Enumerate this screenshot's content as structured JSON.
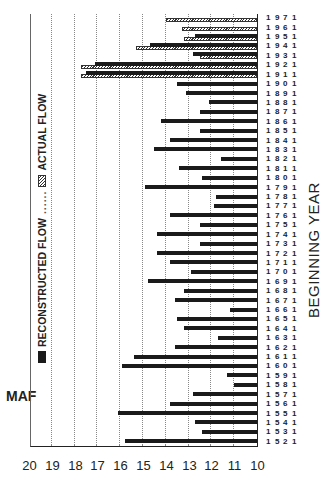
{
  "chart_data": {
    "type": "bar",
    "orientation_note": "figure is displayed rotated 90 degrees counterclockwise",
    "ylabel": "MAF",
    "xlabel": "BEGINNING YEAR",
    "ylim": [
      10,
      20
    ],
    "yticks": [
      10,
      11,
      12,
      13,
      14,
      15,
      16,
      17,
      18,
      19,
      20
    ],
    "grid": true,
    "legend": [
      "RECONSTRUCTED FLOW",
      "ACTUAL FLOW"
    ],
    "categories": [
      "1521",
      "1531",
      "1541",
      "1551",
      "1561",
      "1571",
      "1581",
      "1591",
      "1601",
      "1611",
      "1621",
      "1631",
      "1641",
      "1651",
      "1661",
      "1671",
      "1681",
      "1691",
      "1701",
      "1711",
      "1721",
      "1731",
      "1741",
      "1751",
      "1761",
      "1771",
      "1781",
      "1791",
      "1801",
      "1811",
      "1821",
      "1831",
      "1841",
      "1851",
      "1861",
      "1871",
      "1881",
      "1891",
      "1901",
      "1911",
      "1921",
      "1931",
      "1941",
      "1951",
      "1961",
      "1971"
    ],
    "series": [
      {
        "name": "RECONSTRUCTED FLOW",
        "style": "solid",
        "values": [
          15.8,
          12.4,
          12.7,
          16.1,
          13.8,
          12.8,
          11.0,
          11.3,
          15.9,
          15.4,
          13.6,
          11.7,
          13.2,
          13.5,
          11.2,
          13.6,
          13.2,
          14.8,
          12.9,
          13.8,
          14.4,
          12.5,
          14.4,
          12.5,
          13.8,
          11.9,
          11.8,
          14.9,
          12.4,
          13.4,
          11.6,
          14.5,
          13.8,
          12.5,
          14.2,
          12.5,
          12.1,
          13.1,
          13.5,
          17.5,
          17.1,
          12.8,
          14.7,
          12.7,
          null,
          null
        ]
      },
      {
        "name": "ACTUAL FLOW",
        "style": "hatched",
        "values": [
          null,
          null,
          null,
          null,
          null,
          null,
          null,
          null,
          null,
          null,
          null,
          null,
          null,
          null,
          null,
          null,
          null,
          null,
          null,
          null,
          null,
          null,
          null,
          null,
          null,
          null,
          null,
          null,
          null,
          null,
          null,
          null,
          null,
          null,
          null,
          null,
          null,
          null,
          null,
          17.7,
          17.7,
          12.5,
          15.3,
          13.2,
          13.3,
          14.0
        ]
      }
    ]
  },
  "labels": {
    "ylabel": "MAF",
    "xlabel": "BEGINNING YEAR",
    "legend_reconstructed": "RECONSTRUCTED FLOW",
    "legend_actual": "ACTUAL FLOW",
    "legend_dots": "......"
  }
}
